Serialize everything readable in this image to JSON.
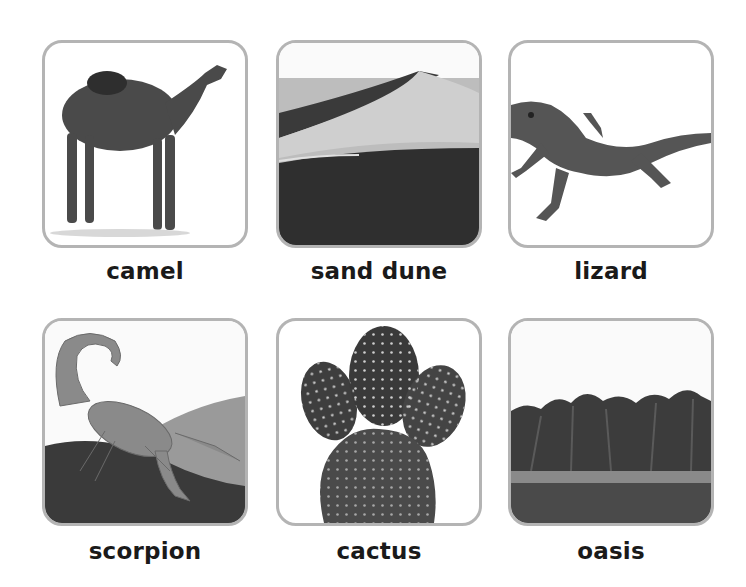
{
  "cards": [
    {
      "label": "camel",
      "image": "camel-photo"
    },
    {
      "label": "sand dune",
      "image": "sand-dune-photo"
    },
    {
      "label": "lizard",
      "image": "lizard-photo"
    },
    {
      "label": "scorpion",
      "image": "scorpion-photo"
    },
    {
      "label": "cactus",
      "image": "cactus-photo"
    },
    {
      "label": "oasis",
      "image": "oasis-photo"
    }
  ],
  "colors": {
    "border": "#b4b4b4",
    "text": "#1a1a1a",
    "background": "#ffffff"
  }
}
